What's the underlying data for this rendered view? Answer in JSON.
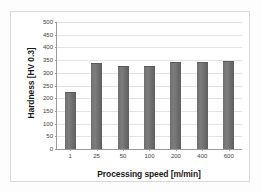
{
  "chart_data": {
    "type": "bar",
    "title": "",
    "xlabel": "Processing speed [m/min]",
    "ylabel": "Hardness [HV 0.3]",
    "categories": [
      "1",
      "25",
      "50",
      "100",
      "200",
      "400",
      "600"
    ],
    "values": [
      225,
      337,
      328,
      328,
      343,
      343,
      347
    ],
    "series": [
      {
        "name": "Hardness",
        "values": [
          225,
          337,
          328,
          328,
          343,
          343,
          347
        ]
      }
    ],
    "ylim": [
      0,
      500
    ],
    "yticks": [
      0,
      50,
      100,
      150,
      200,
      250,
      300,
      350,
      400,
      450,
      500
    ],
    "ytick_labels": [
      "0",
      "50",
      "100",
      "150",
      "200",
      "250",
      "300",
      "350",
      "400",
      "450",
      "500"
    ],
    "grid": true,
    "grid_axis": "y",
    "legend": false,
    "legend_position": "none",
    "bar_color": "#6f6f6f",
    "gridline_color": "#e3e3e3",
    "axis_color": "#9a9a9a",
    "plot_background": "#ffffff"
  }
}
